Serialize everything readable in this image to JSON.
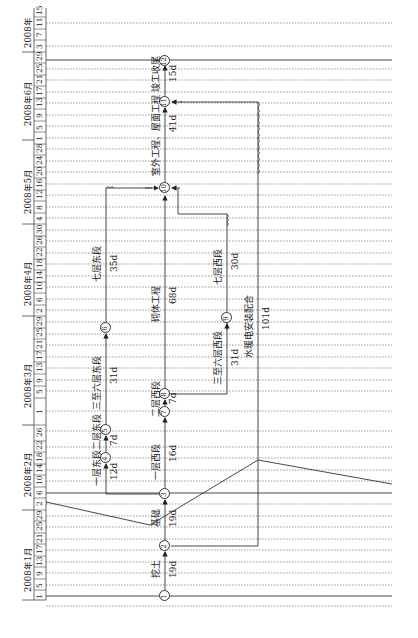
{
  "diagram": {
    "type": "time-scaled network diagram (rotated 90° counter-clockwise)",
    "timeline": {
      "months": [
        {
          "label": "2008年1月",
          "days": [
            "1",
            "5",
            "9",
            "13",
            "17",
            "21",
            "25",
            "29"
          ]
        },
        {
          "label": "2008年2月",
          "days": [
            "2",
            "6",
            "10",
            "14",
            "18",
            "22",
            "26"
          ]
        },
        {
          "label": "2008年3月",
          "days": [
            "1",
            "5",
            "9",
            "13",
            "17",
            "21",
            "25",
            "29"
          ]
        },
        {
          "label": "2008年4月",
          "days": [
            "2",
            "6",
            "10",
            "14",
            "18",
            "22",
            "26",
            "30"
          ]
        },
        {
          "label": "2008年5月",
          "days": [
            "4",
            "8",
            "12",
            "16",
            "20",
            "24",
            "28"
          ]
        },
        {
          "label": "2008年6月",
          "days": [
            "1",
            "5",
            "9",
            "13",
            "17",
            "21",
            "25",
            "29"
          ]
        },
        {
          "label": "2008年",
          "days": [
            "3",
            "7",
            "11",
            "15"
          ]
        }
      ]
    },
    "nodes": [
      {
        "id": "1"
      },
      {
        "id": "2"
      },
      {
        "id": "3"
      },
      {
        "id": "4"
      },
      {
        "id": "5"
      },
      {
        "id": "6"
      },
      {
        "id": "7"
      },
      {
        "id": "8"
      },
      {
        "id": "9"
      },
      {
        "id": "10"
      },
      {
        "id": "11"
      },
      {
        "id": "12"
      }
    ],
    "activities": [
      {
        "from": "1",
        "to": "2",
        "name": "挖土",
        "duration": "19d"
      },
      {
        "from": "2",
        "to": "3",
        "name": "基础",
        "duration": "19d"
      },
      {
        "from": "3",
        "to": "4",
        "name": "一层东段",
        "duration": "12d"
      },
      {
        "from": "4",
        "to": "5",
        "name": "二层东段",
        "duration": "7d"
      },
      {
        "from": "5",
        "to": "6",
        "name": "三至六层东段",
        "duration": "31d"
      },
      {
        "from": "6",
        "to": "10",
        "name": "七层东段",
        "duration": "35d"
      },
      {
        "from": "3",
        "to": "7",
        "name": "一层西段",
        "duration": "16d"
      },
      {
        "from": "7",
        "to": "8",
        "name": "二层西段",
        "duration": "7d"
      },
      {
        "from": "8",
        "to": "9",
        "name": "三至六层西段",
        "duration": "31d"
      },
      {
        "from": "9",
        "to": "10",
        "name": "七层西段",
        "duration": "30d"
      },
      {
        "from": "8",
        "to": "10",
        "name": "砌体工程",
        "duration": "68d"
      },
      {
        "from": "10",
        "to": "11",
        "name": "室外工程、屋面工程",
        "duration": "41d"
      },
      {
        "from": "11",
        "to": "12",
        "name": "竣工收尾",
        "duration": "15d"
      },
      {
        "from": "2",
        "to": "11",
        "name": "水暖电安装配合",
        "duration": "101d"
      }
    ]
  }
}
